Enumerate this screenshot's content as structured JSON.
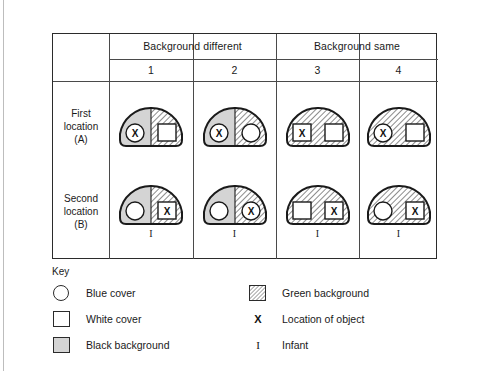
{
  "figure": {
    "header": {
      "corner_label": "",
      "groups": [
        {
          "label": "Background different",
          "span": 2
        },
        {
          "label": "Background same",
          "span": 2
        }
      ],
      "columns": [
        "1",
        "2",
        "3",
        "4"
      ]
    },
    "rows": [
      {
        "label_lines": [
          "First",
          "location",
          "(A)"
        ],
        "cells": [
          {
            "column": "1",
            "left_background": "black",
            "right_background": "green",
            "left_object": {
              "shape": "circle",
              "marked": true,
              "mark": "X"
            },
            "right_object": {
              "shape": "square",
              "marked": false,
              "mark": ""
            },
            "infant": ""
          },
          {
            "column": "2",
            "left_background": "black",
            "right_background": "green",
            "left_object": {
              "shape": "circle",
              "marked": true,
              "mark": "X"
            },
            "right_object": {
              "shape": "circle",
              "marked": false,
              "mark": ""
            },
            "infant": ""
          },
          {
            "column": "3",
            "left_background": "green",
            "right_background": "green",
            "left_object": {
              "shape": "square",
              "marked": true,
              "mark": "X"
            },
            "right_object": {
              "shape": "square",
              "marked": false,
              "mark": ""
            },
            "infant": ""
          },
          {
            "column": "4",
            "left_background": "green",
            "right_background": "green",
            "left_object": {
              "shape": "circle",
              "marked": true,
              "mark": "X"
            },
            "right_object": {
              "shape": "square",
              "marked": false,
              "mark": ""
            },
            "infant": ""
          }
        ]
      },
      {
        "label_lines": [
          "Second",
          "location",
          "(B)"
        ],
        "cells": [
          {
            "column": "1",
            "left_background": "black",
            "right_background": "green",
            "left_object": {
              "shape": "circle",
              "marked": false,
              "mark": ""
            },
            "right_object": {
              "shape": "square",
              "marked": true,
              "mark": "X"
            },
            "infant": "I"
          },
          {
            "column": "2",
            "left_background": "black",
            "right_background": "green",
            "left_object": {
              "shape": "circle",
              "marked": false,
              "mark": ""
            },
            "right_object": {
              "shape": "circle",
              "marked": true,
              "mark": "X"
            },
            "infant": "I"
          },
          {
            "column": "3",
            "left_background": "green",
            "right_background": "green",
            "left_object": {
              "shape": "square",
              "marked": false,
              "mark": ""
            },
            "right_object": {
              "shape": "square",
              "marked": true,
              "mark": "X"
            },
            "infant": "I"
          },
          {
            "column": "4",
            "left_background": "green",
            "right_background": "green",
            "left_object": {
              "shape": "circle",
              "marked": false,
              "mark": ""
            },
            "right_object": {
              "shape": "square",
              "marked": true,
              "mark": "X"
            },
            "infant": "I"
          }
        ]
      }
    ]
  },
  "key": {
    "title": "Key",
    "left_items": [
      {
        "symbol": "circle-outline",
        "label": "Blue cover"
      },
      {
        "symbol": "square-outline",
        "label": "White cover"
      },
      {
        "symbol": "square-gray",
        "label": "Black background"
      }
    ],
    "right_items": [
      {
        "symbol": "square-hatched",
        "label": "Green background"
      },
      {
        "symbol": "letter-x",
        "label": "Location of object"
      },
      {
        "symbol": "letter-i",
        "label": "Infant"
      }
    ]
  },
  "colors": {
    "ink": "#1a1a1a",
    "rule": "#4a4a4a",
    "black_background_fill": "#d4d4d4",
    "green_background_hatch": "#6f6f6f",
    "cover_fill": "#ffffff"
  }
}
